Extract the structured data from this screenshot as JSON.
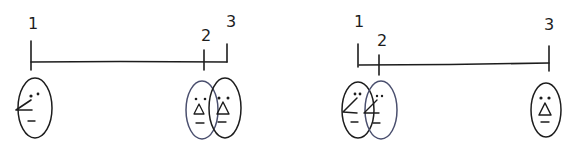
{
  "diagrams": [
    {
      "id": "left",
      "labels": [
        "1",
        "2",
        "3"
      ],
      "description": "Timeline with point 1 far left and points 2 and 3 close together on the right; a profile face under 1, two overlapping surprised frontal faces under 2 and 3"
    },
    {
      "id": "right",
      "labels": [
        "1",
        "2",
        "3"
      ],
      "description": "Timeline with points 1 and 2 close together on the left and point 3 far right; two overlapping profile faces under 1 and 2, a surprised frontal face under 3"
    }
  ],
  "colors": {
    "ink": "#1d1d1d",
    "overlap_ink": "#4a4f6e",
    "background": "#ffffff"
  }
}
